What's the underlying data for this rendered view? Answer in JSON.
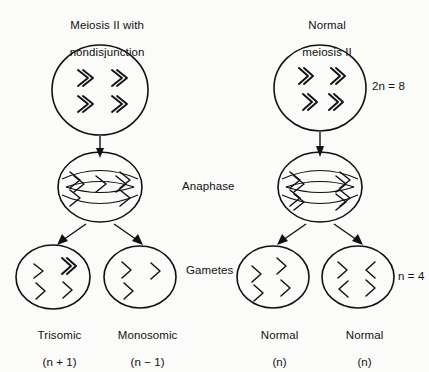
{
  "diagram": {
    "title_left_line1": "Meiosis II with",
    "title_left_line2": "nondisjunction",
    "title_right_line1": "Normal",
    "title_right_line2": "meiosis II",
    "stage_label_anaphase": "Anaphase",
    "stage_label_gametes": "Gametes",
    "ploidy_top": "2n = 8",
    "ploidy_bottom": "n = 4",
    "gametes": [
      {
        "name": "Trisomic",
        "formula": "(n + 1)",
        "chromosome_count": 5
      },
      {
        "name": "Monosomic",
        "formula": "(n − 1)",
        "chromosome_count": 3
      },
      {
        "name": "Normal",
        "formula": "(n)",
        "chromosome_count": 4
      },
      {
        "name": "Normal",
        "formula": "(n)",
        "chromosome_count": 4
      }
    ],
    "colors": {
      "ink": "#111111",
      "background": "#fbfbfa"
    }
  }
}
